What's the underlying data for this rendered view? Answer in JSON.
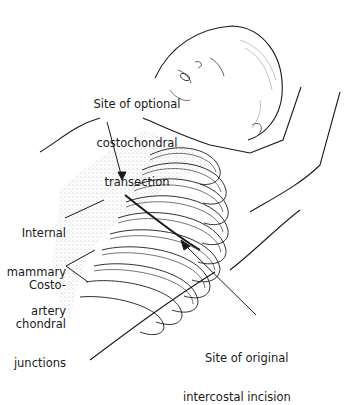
{
  "figure": {
    "type": "medical-illustration",
    "line_color": "#1a1a1a",
    "stipple_color": "#9a9a9a",
    "background": "#ffffff"
  },
  "labels": [
    {
      "id": "costochondral-transection",
      "lines": [
        "Site of optional",
        "costochondral",
        "transection"
      ]
    },
    {
      "id": "internal-mammary-artery",
      "lines": [
        "Internal",
        "mammary",
        "artery"
      ]
    },
    {
      "id": "costochondral-junctions",
      "lines": [
        "Costo-",
        "chondral",
        "junctions"
      ]
    },
    {
      "id": "original-intercostal-incision",
      "lines": [
        "Site of original",
        "intercostal incision"
      ]
    }
  ]
}
